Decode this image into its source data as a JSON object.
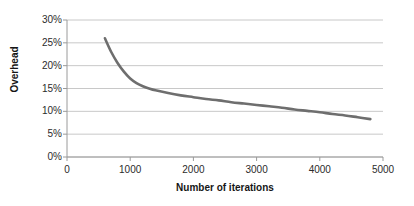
{
  "chart_data": {
    "type": "line",
    "title": "",
    "xlabel": "Number of iterations",
    "ylabel": "Overhead",
    "xlim": [
      0,
      5000
    ],
    "ylim": [
      0,
      30
    ],
    "grid": true,
    "legend": null,
    "line_color": "#6e6e6e",
    "xticks": [
      "0",
      "1000",
      "2000",
      "3000",
      "4000",
      "5000"
    ],
    "xtick_values": [
      0,
      1000,
      2000,
      3000,
      4000,
      5000
    ],
    "yticks": [
      "0%",
      "5%",
      "10%",
      "15%",
      "20%",
      "25%",
      "30%"
    ],
    "ytick_values": [
      0,
      5,
      10,
      15,
      20,
      25,
      30
    ],
    "series": [
      {
        "name": "Overhead",
        "x": [
          600,
          700,
          800,
          900,
          1000,
          1100,
          1200,
          1300,
          1400,
          1600,
          1800,
          2000,
          2200,
          2400,
          2600,
          2800,
          3000,
          3200,
          3400,
          3600,
          3800,
          4000,
          4200,
          4400,
          4600,
          4800
        ],
        "values": [
          26.0,
          23.0,
          20.6,
          18.7,
          17.2,
          16.2,
          15.5,
          15.0,
          14.6,
          14.0,
          13.5,
          13.1,
          12.7,
          12.4,
          12.0,
          11.7,
          11.4,
          11.1,
          10.8,
          10.4,
          10.1,
          9.8,
          9.4,
          9.1,
          8.7,
          8.3
        ]
      }
    ]
  },
  "axes": {
    "y_title": "Overhead",
    "x_title": "Number of iterations"
  }
}
